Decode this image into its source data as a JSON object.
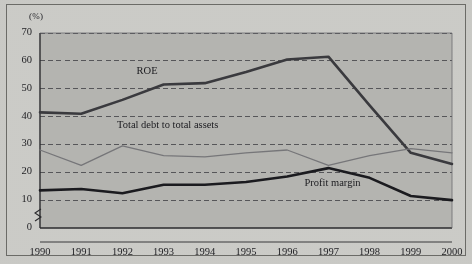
{
  "figure": {
    "axis_unit_label": "(%)",
    "background_color": "#b6b6b2",
    "page_color": "#cdcdc9",
    "frame_color": "#6c6c68"
  },
  "chart_data": {
    "type": "line",
    "title": "",
    "xlabel": "",
    "ylabel": "(%)",
    "ylim": [
      0,
      70
    ],
    "yticks": [
      0,
      10,
      20,
      30,
      40,
      50,
      60,
      70
    ],
    "ytick_labels": [
      "0",
      "10",
      "20",
      "30",
      "40",
      "50",
      "60",
      "70"
    ],
    "grid": true,
    "grid_style": "dashed-horizontal",
    "axis_break": true,
    "axis_break_between": [
      0,
      10
    ],
    "legend_position": "inline-annotation",
    "categories": [
      1990,
      1991,
      1992,
      1993,
      1994,
      1995,
      1996,
      1997,
      1998,
      1999,
      2000
    ],
    "xtick_labels": [
      "1990",
      "1991",
      "1992",
      "1993",
      "1994",
      "1995",
      "1996",
      "1997",
      "1998",
      "1999",
      "2000"
    ],
    "series": [
      {
        "name": "ROE",
        "color": "#3a3a3e",
        "width": 2.6,
        "values": [
          41.5,
          41.0,
          46.0,
          51.5,
          52.0,
          56.0,
          60.5,
          61.5,
          44.0,
          27.0,
          23.0
        ],
        "label_x": 1992.6,
        "label_y": 56.0
      },
      {
        "name": "Total debt to total assets",
        "color": "#77777a",
        "width": 1.3,
        "values": [
          28.0,
          22.5,
          29.5,
          26.0,
          25.5,
          27.0,
          28.0,
          22.5,
          26.0,
          28.5,
          27.0
        ],
        "label_x": 1993.1,
        "label_y": 36.5
      },
      {
        "name": "Profit margin",
        "color": "#1b1b1f",
        "width": 2.6,
        "values": [
          13.5,
          14.0,
          12.5,
          15.5,
          15.5,
          16.5,
          18.5,
          21.5,
          18.0,
          11.5,
          10.0
        ],
        "label_x": 1997.1,
        "label_y": 15.8
      }
    ]
  }
}
